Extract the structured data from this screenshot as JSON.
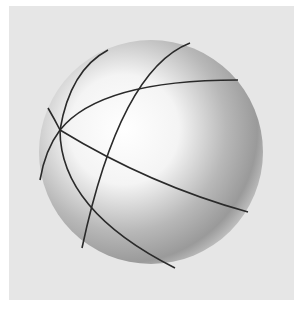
{
  "image": {
    "subject": "shaded sphere drawing with intersecting great-circle lines",
    "colors": {
      "background": "#e6e6e6",
      "border": "#ffffff",
      "highlight": "#ffffff",
      "shadow": "#8a8a8a",
      "lines": "#2a2a2a"
    }
  }
}
